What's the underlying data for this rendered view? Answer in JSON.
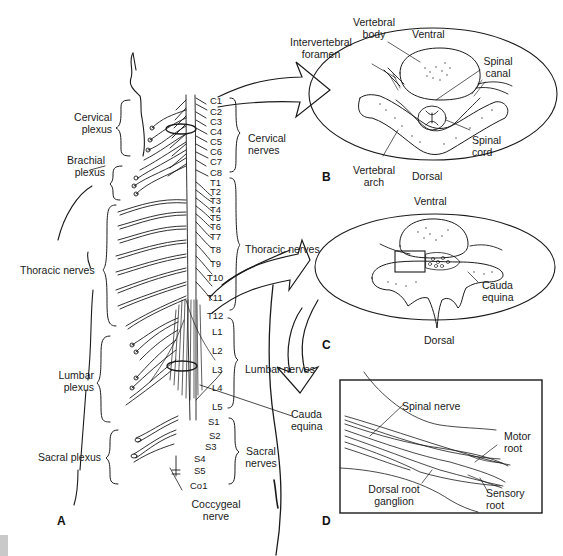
{
  "figure": {
    "panels": {
      "A": {
        "letter": "A",
        "plexus_labels": {
          "cervical_plexus": [
            "Cervical",
            "plexus"
          ],
          "brachial_plexus": [
            "Brachial",
            "plexus"
          ],
          "thoracic_nerves": "Thoracic nerves",
          "lumbar_plexus": [
            "Lumbar",
            "plexus"
          ],
          "sacral_plexus": "Sacral plexus"
        },
        "segments": {
          "cervical": [
            "C1",
            "C2",
            "C3",
            "C4",
            "C5",
            "C6",
            "C7",
            "C8"
          ],
          "thoracic": [
            "T1",
            "T2",
            "T3",
            "T4",
            "T5",
            "T6",
            "T7",
            "T8",
            "T9",
            "T10",
            "T11",
            "T12"
          ],
          "lumbar": [
            "L1",
            "L2",
            "L3",
            "L4",
            "L5"
          ],
          "sacral": [
            "S1",
            "S2",
            "S3",
            "S4",
            "S5"
          ],
          "coccygeal": [
            "Co1"
          ]
        },
        "group_labels": {
          "cervical_nerves": [
            "Cervical",
            "nerves"
          ],
          "thoracic_nerves": "Thoracic nerves",
          "lumbar_nerves": "Lumbar nerves",
          "cauda_equina": [
            "Cauda",
            "equina"
          ],
          "sacral_nerves": [
            "Sacral",
            "nerves"
          ],
          "coccygeal_nerve": [
            "Coccygeal",
            "nerve"
          ]
        }
      },
      "B": {
        "letter": "B",
        "labels": {
          "vertebral_body": [
            "Vertebral",
            "body"
          ],
          "ventral": "Ventral",
          "intervertebral_foramen": [
            "Intervertebral",
            "foramen"
          ],
          "spinal_canal": [
            "Spinal",
            "canal"
          ],
          "spinal_cord": [
            "Spinal",
            "cord"
          ],
          "vertebral_arch": [
            "Vertebral",
            "arch"
          ],
          "dorsal": "Dorsal"
        }
      },
      "C": {
        "letter": "C",
        "labels": {
          "ventral": "Ventral",
          "cauda_equina": [
            "Cauda",
            "equina"
          ],
          "dorsal": "Dorsal"
        }
      },
      "D": {
        "letter": "D",
        "labels": {
          "spinal_nerve": "Spinal nerve",
          "motor_root": [
            "Motor",
            "root"
          ],
          "dorsal_root_ganglion": [
            "Dorsal root",
            "ganglion"
          ],
          "sensory_root": [
            "Sensory",
            "root"
          ]
        }
      }
    },
    "colors": {
      "ink": "#1a1a1a",
      "background": "#ffffff",
      "corner_swatch": "#c9c9c9"
    }
  }
}
